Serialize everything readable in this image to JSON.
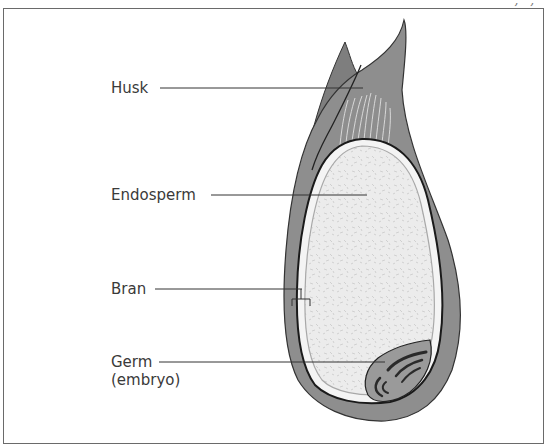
{
  "header": {
    "fragment": ", , "
  },
  "diagram": {
    "labels": {
      "husk": "Husk",
      "endosperm": "Endosperm",
      "bran": "Bran",
      "germ": "Germ",
      "germ_sub": "(embryo)"
    }
  },
  "colors": {
    "husk": "#8e8e8e",
    "husk_dark": "#7a7a7a",
    "bran_layer": "#f2f2f2",
    "endosperm": "#ececec",
    "germ": "#9a9a9a",
    "germ_marks": "#2a2a2a",
    "outline": "#222222",
    "frame": "#6a6a6a",
    "text": "#3a3a3a"
  }
}
